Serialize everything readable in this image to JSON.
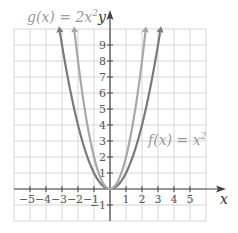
{
  "chart_data": {
    "type": "line",
    "title": "",
    "xlabel": "x",
    "ylabel": "y",
    "xlim": [
      -6,
      6
    ],
    "ylim": [
      -2,
      10
    ],
    "grid": true,
    "x_ticks": [
      -5,
      -4,
      -3,
      -2,
      -1,
      1,
      2,
      3,
      4,
      5
    ],
    "x_tick_labels": [
      "−5",
      "−4",
      "−3",
      "−2",
      "−1",
      "1",
      "2",
      "3",
      "4",
      "5"
    ],
    "y_ticks": [
      -1,
      1,
      2,
      3,
      4,
      5,
      6,
      7,
      8,
      9
    ],
    "y_tick_labels": [
      "−1",
      "1",
      "2",
      "3",
      "4",
      "5",
      "6",
      "7",
      "8",
      "9"
    ],
    "series": [
      {
        "name": "f(x) = x²",
        "expression": "x^2",
        "color": "#7a7a7a",
        "x": [
          -3,
          -2,
          -1,
          0,
          1,
          2,
          3
        ],
        "values": [
          9,
          4,
          1,
          0,
          1,
          4,
          9
        ],
        "label_position": "right, near y=5"
      },
      {
        "name": "g(x) = 2x²",
        "expression": "2x^2",
        "color": "#a8a8a8",
        "x": [
          -2,
          -1,
          0,
          1,
          2
        ],
        "values": [
          8,
          2,
          0,
          2,
          8
        ],
        "label_position": "top left"
      }
    ],
    "annotations": [
      {
        "text": "g(x) = 2x²",
        "position": "top-left"
      },
      {
        "text": "f(x) = x²",
        "position": "right-middle"
      }
    ]
  },
  "labels": {
    "g_label": "g(x) = 2x",
    "g_exp": "2",
    "f_label": "f(x) = x",
    "f_exp": "2",
    "x_axis": "x",
    "y_axis": "y"
  },
  "colors": {
    "grid": "#d4d4d4",
    "axis": "#444444",
    "f_curve": "#7a7a7a",
    "g_curve": "#a8a8a8",
    "tick_text": "#555555",
    "label_text": "#999999"
  }
}
